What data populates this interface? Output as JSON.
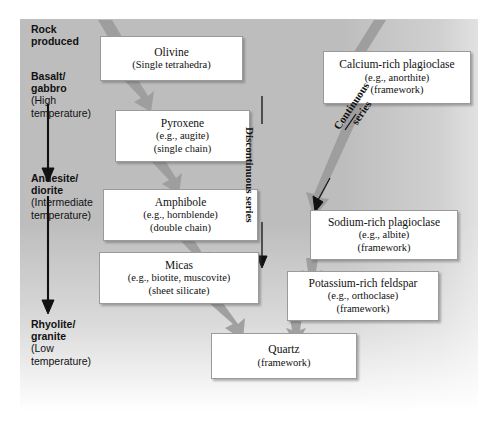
{
  "figure": {
    "type": "bowens-reaction-series-diagram",
    "background_color": "#bdbdbd",
    "box_color": "#ffffff"
  },
  "rock_column": {
    "header": {
      "line1": "Rock",
      "line2": "produced"
    },
    "entries": [
      {
        "name_line1": "Basalt/",
        "name_line2": "gabbro",
        "temp_line1": "(High",
        "temp_line2": "temperature)"
      },
      {
        "name_line1": "Andesite/",
        "name_line2": "diorite",
        "temp_line1": "(Intermediate",
        "temp_line2": "temperature)"
      },
      {
        "name_line1": "Rhyolite/",
        "name_line2": "granite",
        "temp_line1": "(Low",
        "temp_line2": "temperature)"
      }
    ]
  },
  "discontinuous_branch": {
    "label": "Discontinuous series",
    "minerals": [
      {
        "title": "Olivine",
        "sub1": "(Single tetrahedra)",
        "sub2": ""
      },
      {
        "title": "Pyroxene",
        "sub1": "(e.g., augite)",
        "sub2": "(single chain)"
      },
      {
        "title": "Amphibole",
        "sub1": "(e.g., hornblende)",
        "sub2": "(double chain)"
      },
      {
        "title": "Micas",
        "sub1": "(e.g., biotite, muscovite)",
        "sub2": "(sheet silicate)"
      }
    ]
  },
  "continuous_branch": {
    "label_line1": "Continuous",
    "label_line2": "series",
    "minerals": [
      {
        "title": "Calcium-rich plagioclase",
        "sub1": "(e.g., anorthite)",
        "sub2": "(framework)"
      },
      {
        "title": "Sodium-rich plagioclase",
        "sub1": "(e.g., albite)",
        "sub2": "(framework)"
      }
    ]
  },
  "late_minerals": [
    {
      "title": "Potassium-rich feldspar",
      "sub1": "(e.g., orthoclase)",
      "sub2": "(framework)"
    },
    {
      "title": "Quartz",
      "sub1": "(framework)",
      "sub2": ""
    }
  ]
}
